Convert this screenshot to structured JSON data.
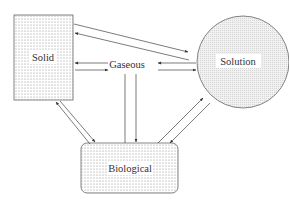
{
  "diagram": {
    "nodes": {
      "solid": {
        "label": "Solid",
        "shape": "rectangle",
        "fill": "dotted"
      },
      "gaseous": {
        "label": "Gaseous",
        "shape": "text"
      },
      "solution": {
        "label": "Solution",
        "shape": "circle",
        "fill": "hatched"
      },
      "biological": {
        "label": "Biological",
        "shape": "rounded-rectangle",
        "fill": "dotted"
      }
    },
    "edges": [
      {
        "from": "solid",
        "to": "solution"
      },
      {
        "from": "solution",
        "to": "solid"
      },
      {
        "from": "gaseous",
        "to": "solid"
      },
      {
        "from": "solid",
        "to": "gaseous"
      },
      {
        "from": "solution",
        "to": "gaseous"
      },
      {
        "from": "gaseous",
        "to": "solution"
      },
      {
        "from": "gaseous",
        "to": "biological"
      },
      {
        "from": "biological",
        "to": "gaseous"
      },
      {
        "from": "solid",
        "to": "biological"
      },
      {
        "from": "biological",
        "to": "solid"
      },
      {
        "from": "solution",
        "to": "biological"
      },
      {
        "from": "biological",
        "to": "solution"
      }
    ],
    "colors": {
      "stroke": "#555555",
      "text": "#333333",
      "background": "#ffffff"
    }
  }
}
